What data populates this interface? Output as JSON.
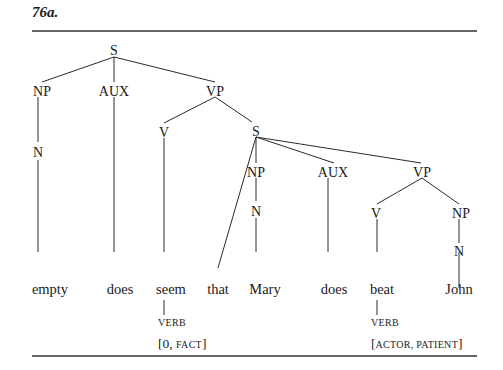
{
  "figure": {
    "label": "76a."
  },
  "tree": {
    "root": "S",
    "nodes": {
      "s_root": "S",
      "np1": "NP",
      "aux1": "AUX",
      "vp1": "VP",
      "n1": "N",
      "v1": "V",
      "s2": "S",
      "np2": "NP",
      "aux2": "AUX",
      "vp2": "VP",
      "n2": "N",
      "v2": "V",
      "np3": "NP",
      "n3": "N"
    },
    "terminals": [
      "empty",
      "does",
      "seem",
      "that",
      "Mary",
      "does",
      "beat",
      "John"
    ],
    "annotations": [
      {
        "word": "seem",
        "category": "verb",
        "frame_open": "[0, ",
        "frame_sc": "fact",
        "frame_close": "]"
      },
      {
        "word": "beat",
        "category": "verb",
        "frame_open": "[",
        "frame_sc": "actor, patient",
        "frame_close": "]"
      }
    ]
  }
}
